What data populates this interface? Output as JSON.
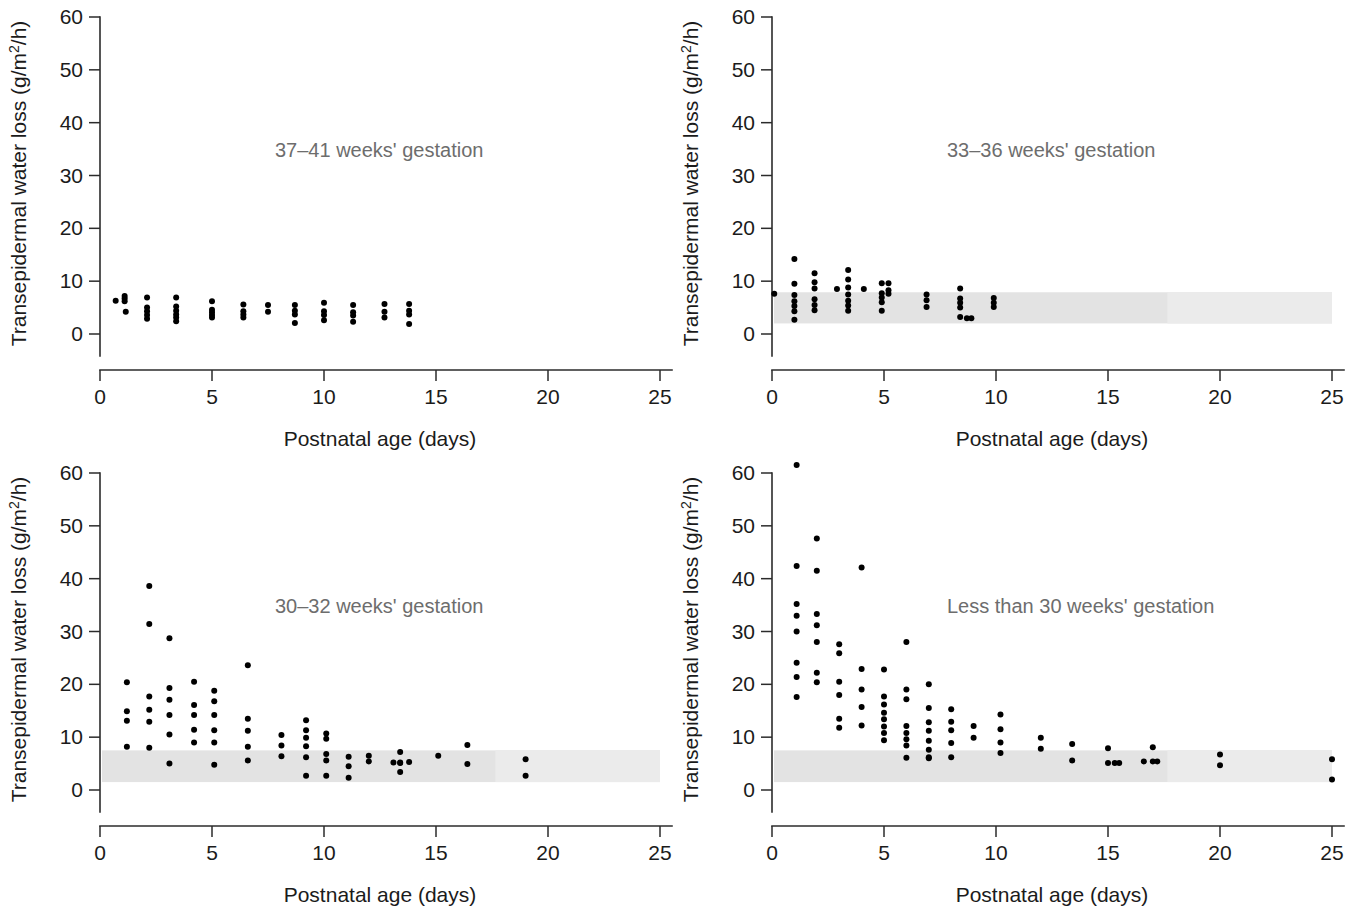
{
  "figure": {
    "background": "#ffffff",
    "dot_color": "#000000",
    "band_color": "#e3e3e3",
    "axis_color": "#2b2b2b",
    "title_color": "#6d6d6d"
  },
  "axes": {
    "xlabel": "Postnatal age (days)",
    "ylabel_prefix": "Transepidermal water loss (g/m",
    "ylabel_sup": "2",
    "ylabel_suffix": "/h)",
    "ylabel_full": "Transepidermal water loss (g/m2/h)",
    "xticks": [
      "0",
      "5",
      "10",
      "15",
      "20",
      "25"
    ],
    "yticks": [
      "0",
      "10",
      "20",
      "30",
      "40",
      "50",
      "60"
    ],
    "xlim": [
      0,
      25
    ],
    "ylim": [
      0,
      60
    ]
  },
  "chart_data": [
    {
      "id": "panel-term",
      "type": "scatter",
      "title": "37–41 weeks' gestation",
      "xlabel": "Postnatal age (days)",
      "ylabel": "Transepidermal water loss (g/m2/h)",
      "xlim": [
        0,
        25
      ],
      "ylim": [
        0,
        60
      ],
      "grid": false,
      "reference_band": null,
      "points": [
        [
          0.7,
          6.3
        ],
        [
          1.1,
          7.2
        ],
        [
          1.1,
          6.7
        ],
        [
          1.1,
          6.2
        ],
        [
          1.15,
          4.2
        ],
        [
          2.1,
          6.9
        ],
        [
          2.1,
          5.0
        ],
        [
          2.1,
          4.3
        ],
        [
          2.1,
          3.6
        ],
        [
          2.1,
          2.9
        ],
        [
          3.4,
          6.9
        ],
        [
          3.4,
          5.2
        ],
        [
          3.4,
          4.4
        ],
        [
          3.4,
          3.7
        ],
        [
          3.4,
          3.1
        ],
        [
          3.4,
          2.4
        ],
        [
          5.0,
          6.2
        ],
        [
          5.0,
          4.6
        ],
        [
          5.0,
          4.1
        ],
        [
          5.0,
          3.6
        ],
        [
          5.0,
          3.1
        ],
        [
          6.4,
          5.6
        ],
        [
          6.4,
          4.3
        ],
        [
          6.4,
          3.7
        ],
        [
          6.4,
          3.1
        ],
        [
          7.5,
          5.5
        ],
        [
          7.5,
          4.2
        ],
        [
          8.7,
          5.5
        ],
        [
          8.7,
          4.4
        ],
        [
          8.7,
          3.7
        ],
        [
          8.7,
          2.1
        ],
        [
          10.0,
          5.9
        ],
        [
          10.0,
          4.3
        ],
        [
          10.0,
          3.6
        ],
        [
          10.0,
          2.6
        ],
        [
          11.3,
          5.5
        ],
        [
          11.3,
          4.1
        ],
        [
          11.3,
          3.5
        ],
        [
          11.3,
          2.3
        ],
        [
          12.7,
          5.7
        ],
        [
          12.7,
          4.2
        ],
        [
          12.7,
          3.1
        ],
        [
          13.8,
          5.7
        ],
        [
          13.8,
          4.4
        ],
        [
          13.8,
          3.7
        ],
        [
          13.8,
          1.9
        ]
      ]
    },
    {
      "id": "panel-33-36",
      "type": "scatter",
      "title": "33–36 weeks' gestation",
      "xlabel": "Postnatal age (days)",
      "ylabel": "Transepidermal water loss (g/m2/h)",
      "xlim": [
        0,
        25
      ],
      "ylim": [
        0,
        60
      ],
      "grid": false,
      "reference_band": {
        "low": 2.0,
        "high": 7.9,
        "label": "reference range"
      },
      "points": [
        [
          0.1,
          7.6
        ],
        [
          1.0,
          14.2
        ],
        [
          1.0,
          9.5
        ],
        [
          1.0,
          7.4
        ],
        [
          1.0,
          6.2
        ],
        [
          1.0,
          5.3
        ],
        [
          1.0,
          4.3
        ],
        [
          1.0,
          2.7
        ],
        [
          1.9,
          11.5
        ],
        [
          1.9,
          9.8
        ],
        [
          1.9,
          8.6
        ],
        [
          1.9,
          6.6
        ],
        [
          1.9,
          5.5
        ],
        [
          1.9,
          4.5
        ],
        [
          2.9,
          8.5
        ],
        [
          3.4,
          12.1
        ],
        [
          3.4,
          10.3
        ],
        [
          3.4,
          8.8
        ],
        [
          3.4,
          7.5
        ],
        [
          3.4,
          6.3
        ],
        [
          3.4,
          5.4
        ],
        [
          3.4,
          4.4
        ],
        [
          4.1,
          8.5
        ],
        [
          4.9,
          9.6
        ],
        [
          4.9,
          7.7
        ],
        [
          4.9,
          6.9
        ],
        [
          4.9,
          6.0
        ],
        [
          4.9,
          4.4
        ],
        [
          5.2,
          9.6
        ],
        [
          5.2,
          8.3
        ],
        [
          5.2,
          7.6
        ],
        [
          6.9,
          7.5
        ],
        [
          6.9,
          6.4
        ],
        [
          6.9,
          5.1
        ],
        [
          8.4,
          8.6
        ],
        [
          8.4,
          6.7
        ],
        [
          8.4,
          5.9
        ],
        [
          8.4,
          5.0
        ],
        [
          8.4,
          3.2
        ],
        [
          8.7,
          3.0
        ],
        [
          8.9,
          3.0
        ],
        [
          9.9,
          6.8
        ],
        [
          9.9,
          5.9
        ],
        [
          9.9,
          5.1
        ]
      ]
    },
    {
      "id": "panel-30-32",
      "type": "scatter",
      "title": "30–32 weeks' gestation",
      "xlabel": "Postnatal age (days)",
      "ylabel": "Transepidermal water loss (g/m2/h)",
      "xlim": [
        0,
        25
      ],
      "ylim": [
        0,
        60
      ],
      "grid": false,
      "reference_band": {
        "low": 1.5,
        "high": 7.5,
        "label": "reference range"
      },
      "points": [
        [
          1.2,
          20.4
        ],
        [
          1.2,
          14.9
        ],
        [
          1.2,
          13.1
        ],
        [
          1.2,
          8.2
        ],
        [
          2.2,
          38.6
        ],
        [
          2.2,
          31.4
        ],
        [
          2.2,
          17.7
        ],
        [
          2.2,
          15.2
        ],
        [
          2.2,
          12.9
        ],
        [
          2.2,
          8.0
        ],
        [
          3.1,
          28.7
        ],
        [
          3.1,
          19.3
        ],
        [
          3.1,
          17.1
        ],
        [
          3.1,
          14.2
        ],
        [
          3.1,
          10.5
        ],
        [
          3.1,
          5.0
        ],
        [
          4.2,
          20.5
        ],
        [
          4.2,
          16.1
        ],
        [
          4.2,
          14.2
        ],
        [
          4.2,
          11.4
        ],
        [
          4.2,
          9.0
        ],
        [
          5.1,
          18.8
        ],
        [
          5.1,
          16.8
        ],
        [
          5.1,
          14.2
        ],
        [
          5.1,
          11.3
        ],
        [
          5.1,
          9.0
        ],
        [
          5.1,
          4.8
        ],
        [
          6.6,
          23.6
        ],
        [
          6.6,
          13.5
        ],
        [
          6.6,
          11.2
        ],
        [
          6.6,
          8.2
        ],
        [
          6.6,
          5.6
        ],
        [
          8.1,
          10.4
        ],
        [
          8.1,
          8.4
        ],
        [
          8.1,
          6.4
        ],
        [
          9.2,
          13.2
        ],
        [
          9.2,
          11.3
        ],
        [
          9.2,
          9.9
        ],
        [
          9.2,
          8.3
        ],
        [
          9.2,
          6.2
        ],
        [
          9.2,
          2.7
        ],
        [
          10.1,
          10.7
        ],
        [
          10.1,
          9.7
        ],
        [
          10.1,
          6.8
        ],
        [
          10.1,
          5.6
        ],
        [
          10.1,
          2.7
        ],
        [
          11.1,
          6.3
        ],
        [
          11.1,
          4.5
        ],
        [
          11.1,
          2.3
        ],
        [
          12.0,
          6.5
        ],
        [
          12.0,
          5.4
        ],
        [
          13.1,
          5.2
        ],
        [
          13.4,
          7.2
        ],
        [
          13.4,
          5.2
        ],
        [
          13.4,
          5.1
        ],
        [
          13.4,
          3.4
        ],
        [
          13.8,
          5.3
        ],
        [
          15.1,
          6.5
        ],
        [
          16.4,
          8.5
        ],
        [
          16.4,
          4.9
        ],
        [
          19.0,
          5.8
        ],
        [
          19.0,
          2.7
        ]
      ]
    },
    {
      "id": "panel-lt30",
      "type": "scatter",
      "title": "Less than 30 weeks' gestation",
      "xlabel": "Postnatal age (days)",
      "ylabel": "Transepidermal water loss (g/m2/h)",
      "xlim": [
        0,
        25
      ],
      "ylim": [
        0,
        60
      ],
      "grid": false,
      "reference_band": {
        "low": 1.5,
        "high": 7.5,
        "label": "reference range"
      },
      "points": [
        [
          1.1,
          61.5
        ],
        [
          1.1,
          42.4
        ],
        [
          1.1,
          35.2
        ],
        [
          1.1,
          33.0
        ],
        [
          1.1,
          30.0
        ],
        [
          1.1,
          24.1
        ],
        [
          1.1,
          21.4
        ],
        [
          1.1,
          17.6
        ],
        [
          2.0,
          47.6
        ],
        [
          2.0,
          41.5
        ],
        [
          2.0,
          33.3
        ],
        [
          2.0,
          31.2
        ],
        [
          2.0,
          28.0
        ],
        [
          2.0,
          22.2
        ],
        [
          2.0,
          20.4
        ],
        [
          3.0,
          27.6
        ],
        [
          3.0,
          25.9
        ],
        [
          3.0,
          20.5
        ],
        [
          3.0,
          18.0
        ],
        [
          3.0,
          13.5
        ],
        [
          3.0,
          11.8
        ],
        [
          4.0,
          42.1
        ],
        [
          4.0,
          22.9
        ],
        [
          4.0,
          19.0
        ],
        [
          4.0,
          15.7
        ],
        [
          4.0,
          12.2
        ],
        [
          5.0,
          22.8
        ],
        [
          5.0,
          17.7
        ],
        [
          5.0,
          16.2
        ],
        [
          5.0,
          14.6
        ],
        [
          5.0,
          13.4
        ],
        [
          5.0,
          12.0
        ],
        [
          5.0,
          10.8
        ],
        [
          5.0,
          9.4
        ],
        [
          6.0,
          28.0
        ],
        [
          6.0,
          19.0
        ],
        [
          6.0,
          17.2
        ],
        [
          6.0,
          12.1
        ],
        [
          6.0,
          10.8
        ],
        [
          6.0,
          9.6
        ],
        [
          6.0,
          8.4
        ],
        [
          6.0,
          6.1
        ],
        [
          7.0,
          20.0
        ],
        [
          7.0,
          15.5
        ],
        [
          7.0,
          12.8
        ],
        [
          7.0,
          11.2
        ],
        [
          7.0,
          9.3
        ],
        [
          7.0,
          7.6
        ],
        [
          7.0,
          6.2
        ],
        [
          7.0,
          6.0
        ],
        [
          8.0,
          15.3
        ],
        [
          8.0,
          12.9
        ],
        [
          8.0,
          11.3
        ],
        [
          8.0,
          8.9
        ],
        [
          8.0,
          6.2
        ],
        [
          9.0,
          12.1
        ],
        [
          9.0,
          9.9
        ],
        [
          10.2,
          14.3
        ],
        [
          10.2,
          11.5
        ],
        [
          10.2,
          9.0
        ],
        [
          10.2,
          7.0
        ],
        [
          12.0,
          9.9
        ],
        [
          12.0,
          7.8
        ],
        [
          13.4,
          8.7
        ],
        [
          13.4,
          5.6
        ],
        [
          15.0,
          7.9
        ],
        [
          15.0,
          5.1
        ],
        [
          15.3,
          5.1
        ],
        [
          15.5,
          5.1
        ],
        [
          16.6,
          5.4
        ],
        [
          17.0,
          8.1
        ],
        [
          17.0,
          5.4
        ],
        [
          17.2,
          5.4
        ],
        [
          20.0,
          6.7
        ],
        [
          20.0,
          4.7
        ],
        [
          25.0,
          5.8
        ],
        [
          25.0,
          2.0
        ]
      ]
    }
  ]
}
